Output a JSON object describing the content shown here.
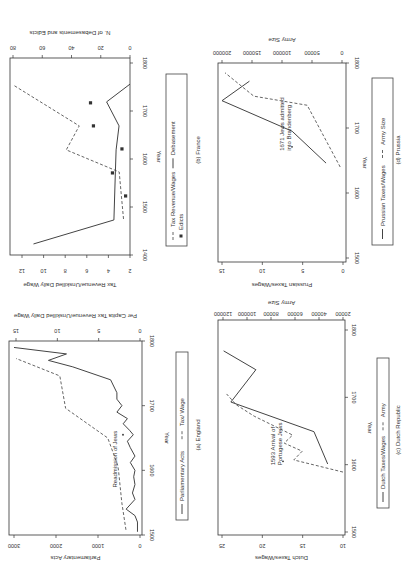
{
  "page": {
    "orientation_note": "figure rotated 90 degrees on page"
  },
  "chart_data": [
    {
      "id": "france",
      "type": "line",
      "caption": "(b) France",
      "xlabel": "Year",
      "ylabel": "Tax Revenue/Unskilled Daily Wage",
      "ylabel2": "N. of Debasements and Edicts",
      "x_ticks": [
        1400,
        1500,
        1600,
        1700,
        1800
      ],
      "y_ticks": [
        2,
        4,
        6,
        8,
        10,
        12
      ],
      "y2_ticks": [
        0,
        20,
        40,
        60,
        80
      ],
      "legend": [
        "Tax Revenue/Wages",
        "Debasement",
        "Edicts"
      ],
      "series": [
        {
          "name": "Tax Revenue/Wages",
          "axis": "y",
          "style": "dashed",
          "x": [
            1475,
            1573,
            1619,
            1669,
            1754
          ],
          "values": [
            2.6,
            3.0,
            7.9,
            6.7,
            12.8
          ]
        },
        {
          "name": "Debasement",
          "axis": "y2",
          "style": "solid",
          "x": [
            1423,
            1473,
            1573,
            1619,
            1669,
            1719,
            1756
          ],
          "values": [
            66,
            11,
            10,
            9.5,
            7.5,
            16,
            0
          ]
        },
        {
          "name": "Edicts",
          "axis": "y2",
          "style": "points",
          "x": [
            1523,
            1571,
            1621,
            1669,
            1717
          ],
          "values": [
            3,
            12,
            5.5,
            25,
            27
          ]
        }
      ]
    },
    {
      "id": "prussia",
      "type": "line",
      "caption": "(d) Prussia",
      "xlabel": "Year",
      "ylabel": "Prussian Taxes/Wages",
      "ylabel2": "Army Size",
      "x_ticks": [
        1500,
        1600,
        1700,
        1800
      ],
      "y_ticks": [
        0,
        5,
        10,
        15
      ],
      "y2_ticks": [
        0,
        50000,
        100000,
        150000,
        200000
      ],
      "legend": [
        "Prussian Taxes/Wages",
        "Army Size"
      ],
      "annotation": {
        "text": [
          "1671 Jews admitted",
          "into Brandenberg"
        ],
        "year": 1671
      },
      "series": [
        {
          "name": "Prussian Taxes/Wages",
          "axis": "y",
          "style": "solid",
          "x": [
            1646,
            1695,
            1742,
            1772
          ],
          "values": [
            2.1,
            6.3,
            15,
            11.6
          ]
        },
        {
          "name": "Army Size",
          "axis": "y2",
          "style": "dashed",
          "x": [
            1640,
            1735,
            1749,
            1785
          ],
          "values": [
            3000,
            58000,
            147000,
            195000
          ]
        }
      ]
    },
    {
      "id": "england",
      "type": "line",
      "caption": "(a) England",
      "xlabel": "Year",
      "ylabel": "Parliamentary Acts",
      "ylabel2": "Per Capita Tax Revenue/Unskilled Daily Wage",
      "x_ticks": [
        1500,
        1600,
        1700,
        1800
      ],
      "y_ticks": [
        0,
        1000,
        2000,
        3000
      ],
      "y2_ticks": [
        0,
        5,
        10,
        15
      ],
      "legend": [
        "Parliamentary Acts",
        "Tax/ Wage"
      ],
      "annotation": {
        "text": [
          "Readmission of Jews"
        ],
        "year": 1655
      },
      "series": [
        {
          "name": "Parliamentary Acts",
          "axis": "y",
          "style": "solid",
          "x": [
            1505,
            1520,
            1530,
            1540,
            1555,
            1565,
            1578,
            1590,
            1600,
            1612,
            1622,
            1635,
            1645,
            1655,
            1662,
            1672,
            1680,
            1690,
            1700,
            1710,
            1720,
            1740,
            1760,
            1770,
            1780,
            1790
          ],
          "values": [
            60,
            60,
            120,
            330,
            120,
            180,
            120,
            150,
            120,
            230,
            120,
            230,
            300,
            160,
            250,
            400,
            300,
            550,
            430,
            550,
            550,
            700,
            1600,
            2180,
            1750,
            3000
          ]
        },
        {
          "name": "Tax/ Wage",
          "axis": "y2",
          "style": "dashed",
          "x": [
            1508,
            1550,
            1600,
            1608,
            1650,
            1696,
            1746,
            1773
          ],
          "values": [
            1.7,
            2.2,
            2.6,
            2.7,
            3.9,
            9.0,
            9.7,
            15.0
          ]
        }
      ]
    },
    {
      "id": "dutch",
      "type": "line",
      "caption": "(c) Dutch Republic",
      "xlabel": "Year",
      "ylabel": "Dutch Taxes/Wages",
      "ylabel2": "Army Size",
      "x_ticks": [
        1500,
        1600,
        1700,
        1800
      ],
      "y_ticks": [
        10,
        15,
        20,
        25
      ],
      "y2_ticks": [
        20000,
        40000,
        60000,
        80000,
        100000,
        120000
      ],
      "legend": [
        "Dutch Taxes/Wages",
        "Army"
      ],
      "annotation": {
        "text": [
          "1593 Arrival of",
          "Portugese Jews"
        ],
        "year": 1605
      },
      "series": [
        {
          "name": "Dutch Taxes/Wages",
          "axis": "y",
          "style": "solid",
          "x": [
            1601,
            1649,
            1693,
            1741,
            1769
          ],
          "values": [
            11.9,
            13.6,
            23.9,
            20.8,
            24.8
          ]
        },
        {
          "name": "Army",
          "axis": "y2",
          "style": "dashed",
          "x": [
            1589,
            1607,
            1620,
            1632,
            1644,
            1672,
            1689,
            1705
          ],
          "values": [
            20000,
            61000,
            54000,
            69000,
            62000,
            94000,
            109000,
            117000
          ]
        }
      ]
    }
  ]
}
